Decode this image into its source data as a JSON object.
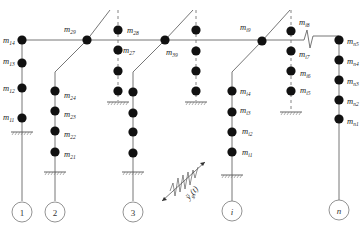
{
  "diagram": {
    "structures": [
      {
        "id": "1",
        "label": "1",
        "masses": [
          "m11",
          "m12",
          "m13",
          "m14"
        ]
      },
      {
        "id": "2",
        "label": "2",
        "masses": [
          "m21",
          "m22",
          "m23",
          "m24"
        ],
        "offset_masses": [
          "m25",
          "m26",
          "m27",
          "m28"
        ],
        "junction": "m29"
      },
      {
        "id": "3",
        "label": "3",
        "masses": [
          "m31",
          "m32",
          "m33",
          "m34"
        ],
        "offset_masses": [
          "m35",
          "m36",
          "m37",
          "m38"
        ],
        "junction": "m39"
      },
      {
        "id": "i",
        "label": "i",
        "masses": [
          "mi1",
          "mi2",
          "mi3",
          "mi4"
        ],
        "offset_masses": [
          "mi5",
          "mi6",
          "mi7",
          "mi8"
        ],
        "junction": "mi9"
      },
      {
        "id": "n",
        "label": "n",
        "masses": [
          "mn1",
          "mn2",
          "mn3",
          "mn4",
          "mn5"
        ]
      }
    ],
    "labels": {
      "m14": {
        "base": "m",
        "sub": "14"
      },
      "m13": {
        "base": "m",
        "sub": "13"
      },
      "m12": {
        "base": "m",
        "sub": "12"
      },
      "m11": {
        "base": "m",
        "sub": "11"
      },
      "m29": {
        "base": "m",
        "sub": "29"
      },
      "m28": {
        "base": "m",
        "sub": "28"
      },
      "m27": {
        "base": "m",
        "sub": "27"
      },
      "m24": {
        "base": "m",
        "sub": "24"
      },
      "m23": {
        "base": "m",
        "sub": "23"
      },
      "m22": {
        "base": "m",
        "sub": "22"
      },
      "m21": {
        "base": "m",
        "sub": "21"
      },
      "m39": {
        "base": "m",
        "sub": "39"
      },
      "mi9": {
        "base": "m",
        "sub": "i9"
      },
      "mi8": {
        "base": "m",
        "sub": "i8"
      },
      "mi7": {
        "base": "m",
        "sub": "i7"
      },
      "mi6": {
        "base": "m",
        "sub": "i6"
      },
      "mi5": {
        "base": "m",
        "sub": "i5"
      },
      "mi4": {
        "base": "m",
        "sub": "i4"
      },
      "mi3": {
        "base": "m",
        "sub": "i3"
      },
      "mi2": {
        "base": "m",
        "sub": "i2"
      },
      "mi1": {
        "base": "m",
        "sub": "i1"
      },
      "mn5": {
        "base": "m",
        "sub": "n5"
      },
      "mn4": {
        "base": "m",
        "sub": "n4"
      },
      "mn3": {
        "base": "m",
        "sub": "n3"
      },
      "mn2": {
        "base": "m",
        "sub": "n2"
      },
      "mn1": {
        "base": "m",
        "sub": "n1"
      }
    },
    "node_labels": {
      "n1": "1",
      "n2": "2",
      "n3": "3",
      "ni": "i",
      "nn": "n"
    },
    "excitation": {
      "base": "ÿ",
      "sub": "g",
      "arg": "(t)"
    },
    "colors": {
      "line": "#555555",
      "mass": "#111111",
      "ground": "#666666",
      "circle": "#777777"
    }
  }
}
